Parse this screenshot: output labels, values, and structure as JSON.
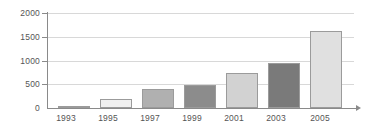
{
  "chart_data": {
    "type": "bar",
    "title": "",
    "subtitle": "",
    "xlabel": "",
    "ylabel": "",
    "categories": [
      "1993",
      "1995",
      "1997",
      "1999",
      "2001",
      "2003",
      "2005"
    ],
    "values": [
      50,
      200,
      390,
      490,
      735,
      950,
      1630
    ],
    "series": [
      {
        "name": "",
        "values": [
          50,
          200,
          390,
          490,
          735,
          950,
          1630
        ]
      }
    ],
    "bar_colors": [
      "#6e6e6e",
      "#f0f0f0",
      "#b0b0b0",
      "#8c8c8c",
      "#d2d2d2",
      "#7a7a7a",
      "#e0e0e0"
    ],
    "bar_border_color": "#9b9b9b",
    "ylim": [
      0,
      2000
    ],
    "yticks": [
      0,
      500,
      1000,
      1500,
      2000
    ],
    "ytick_labels": [
      "0",
      "500",
      "1000",
      "1500",
      "2000"
    ],
    "grid": true,
    "grid_color": "#d8d8d8",
    "axis_color": "#8a8a8a",
    "legend": false,
    "legend_position": "none",
    "background_color": "#ffffff",
    "tick_label_color": "#555555"
  }
}
